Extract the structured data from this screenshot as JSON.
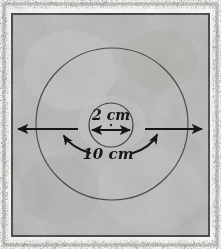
{
  "figure": {
    "kind": "hand-drawn-geometry-diagram",
    "medium": "scanned photograph with dark speckled frame border"
  },
  "colors": {
    "background_paper": "#b9b9b7",
    "background_light": "#cfcfcd",
    "background_dark": "#a3a3a1",
    "frame_outer_white": "#fdfdfb",
    "frame_speckle": "#5d5c58",
    "frame_inner_line": "#3a3a37",
    "ink": "#171717",
    "circle_stroke": "#4a4a47"
  },
  "shapes": {
    "outer_circle": {
      "name": "outer-circle",
      "cx": 112,
      "cy": 124,
      "r": 76,
      "label": "10 cm"
    },
    "inner_circle": {
      "name": "inner-circle",
      "cx": 111,
      "cy": 125,
      "r": 22,
      "label": "2 cm"
    },
    "center_dot": {
      "name": "center-dot",
      "cx": 111,
      "cy": 125,
      "r": 1.2
    }
  },
  "annotations": {
    "inner_diameter": {
      "name": "inner-diameter-arrow",
      "text": "2 cm",
      "value": 2,
      "unit": "cm",
      "measures": "inner circle diameter",
      "text_x": 111,
      "text_y": 119,
      "font_size": 14,
      "arrow_y": 130,
      "arrow_x1": 90,
      "arrow_x2": 132
    },
    "outer_diameter": {
      "name": "outer-diameter-arrow",
      "text": "10 cm",
      "value": 10,
      "unit": "cm",
      "measures": "outer circle diameter",
      "text_x": 106,
      "text_y": 158,
      "font_size": 15,
      "arrow_y": 129,
      "left_arrow_x1": 78,
      "left_arrow_x2": 16,
      "right_arrow_x1": 145,
      "right_arrow_x2": 204
    },
    "leader_left": {
      "name": "leader-arrow-left",
      "from_x": 88,
      "from_y": 152,
      "to_x": 63,
      "to_y": 135
    },
    "leader_right": {
      "name": "leader-arrow-right",
      "from_x": 134,
      "from_y": 152,
      "to_x": 158,
      "to_y": 134
    }
  },
  "frame": {
    "name": "photo-frame",
    "outer_margin_px": 4,
    "speckle_band_px": 4,
    "inner_white_gap_px": 3,
    "inner_line_px": 2
  }
}
